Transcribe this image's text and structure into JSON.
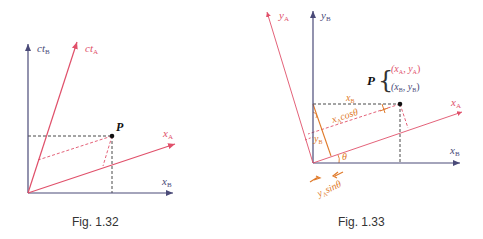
{
  "colors": {
    "frame_b": "#4a4a78",
    "frame_a": "#e0506a",
    "dashed": "#333333",
    "projection": "#e07a2a",
    "point": "#111111",
    "caption": "#333333"
  },
  "figures": [
    {
      "caption": "Fig. 1.32",
      "labels": {
        "ct_b": "ct",
        "ct_b_sub": "B",
        "ct_a": "ct",
        "ct_a_sub": "A",
        "x_a": "x",
        "x_a_sub": "A",
        "x_b": "x",
        "x_b_sub": "B",
        "point": "P"
      }
    },
    {
      "caption": "Fig. 1.33",
      "labels": {
        "y_a": "y",
        "y_a_sub": "A",
        "y_b": "y",
        "y_b_sub": "B",
        "x_a": "x",
        "x_a_sub": "A",
        "x_b": "x",
        "x_b_sub": "B",
        "point": "P",
        "coord_a": "(x",
        "coord_a_sub1": "A",
        "coord_a_mid": ", y",
        "coord_a_sub2": "A",
        "coord_a_end": ")",
        "coord_b": "(x",
        "coord_b_sub1": "B",
        "coord_b_mid": ", y",
        "coord_b_sub2": "B",
        "coord_b_end": ")",
        "seg_xb": "x",
        "seg_xb_sub": "B",
        "seg_xacos": "x",
        "seg_xacos_sub": "A",
        "seg_xacos_rest": "cosθ",
        "seg_yb": "y",
        "seg_yb_sub": "B",
        "theta": "θ",
        "seg_yasin": "y",
        "seg_yasin_sub": "A",
        "seg_yasin_rest": "sinθ"
      }
    }
  ]
}
